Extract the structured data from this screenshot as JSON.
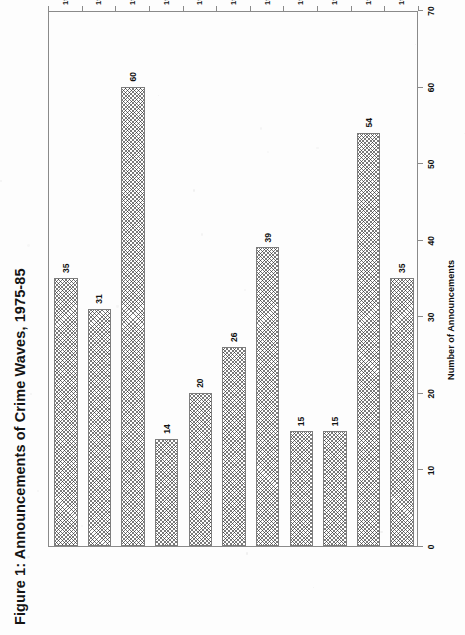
{
  "figure": {
    "title": "Figure 1:  Announcements of Crime Waves, 1975-85",
    "value_axis_title": "Number of Announcements"
  },
  "chart_data": {
    "type": "bar",
    "orientation": "vertical",
    "title": "Figure 1:  Announcements of Crime Waves, 1975-85",
    "xlabel": "",
    "ylabel": "Number of Announcements",
    "categories": [
      "1975",
      "1976",
      "1977",
      "1978",
      "1979",
      "1980",
      "1981",
      "1982",
      "1983",
      "1984",
      "1985"
    ],
    "values": [
      35,
      31,
      60,
      14,
      20,
      26,
      39,
      15,
      15,
      54,
      35
    ],
    "data_labels": [
      "35",
      "31",
      "60",
      "14",
      "20",
      "26",
      "39",
      "15",
      "15",
      "54",
      "35"
    ],
    "ylim": [
      0,
      70
    ],
    "yticks": [
      0,
      10,
      20,
      30,
      40,
      50,
      60,
      70
    ],
    "ytick_labels": [
      "0",
      "10",
      "20",
      "30",
      "40",
      "50",
      "60",
      "70"
    ],
    "grid": false,
    "legend": null,
    "series": [
      {
        "name": "Announcements of Crime Waves",
        "values": [
          35,
          31,
          60,
          14,
          20,
          26,
          39,
          15,
          15,
          54,
          35
        ]
      }
    ]
  },
  "style": {
    "bar_fill": "#ffffff",
    "bar_pattern": "crosshatch",
    "bar_edge": "#7d7d7d",
    "frame": "#8a8a8a",
    "text": "#111111",
    "background": "#fdfdfd"
  }
}
